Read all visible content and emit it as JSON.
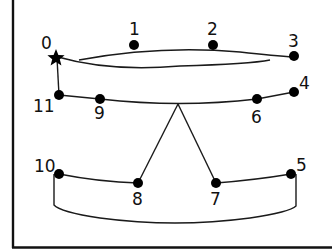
{
  "diagram": {
    "type": "numbered-node-graph",
    "colors": {
      "ink": "#000000",
      "background": "#ffffff"
    },
    "start_marker": {
      "id": "0",
      "label": "0",
      "icon": "star-icon"
    },
    "nodes": [
      {
        "id": "1",
        "label": "1"
      },
      {
        "id": "2",
        "label": "2"
      },
      {
        "id": "3",
        "label": "3"
      },
      {
        "id": "4",
        "label": "4"
      },
      {
        "id": "5",
        "label": "5"
      },
      {
        "id": "6",
        "label": "6"
      },
      {
        "id": "7",
        "label": "7"
      },
      {
        "id": "8",
        "label": "8"
      },
      {
        "id": "9",
        "label": "9"
      },
      {
        "id": "10",
        "label": "10"
      },
      {
        "id": "11",
        "label": "11"
      }
    ],
    "edges": [
      {
        "from": "0",
        "to": "3",
        "style": "double-lens"
      },
      {
        "from": "0",
        "to": "11",
        "style": "straight"
      },
      {
        "from": "11",
        "to": "9",
        "style": "curve"
      },
      {
        "from": "9",
        "to": "6",
        "style": "curve"
      },
      {
        "from": "6",
        "to": "4",
        "style": "straight"
      },
      {
        "from": "fork",
        "to": "8",
        "style": "straight"
      },
      {
        "from": "fork",
        "to": "7",
        "style": "straight"
      },
      {
        "from": "10",
        "to": "8",
        "style": "curve"
      },
      {
        "from": "7",
        "to": "5",
        "style": "curve"
      },
      {
        "from": "10",
        "to": "5",
        "style": "bottom-loop"
      }
    ]
  }
}
